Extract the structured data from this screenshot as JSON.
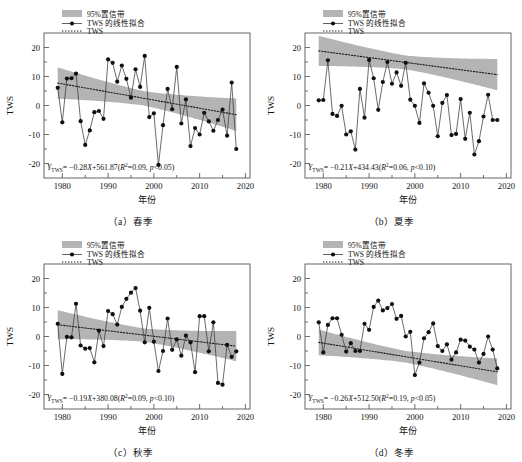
{
  "figure": {
    "panel_count": 4,
    "series_color": "#3a3a3a",
    "band_color": "#b4b4b4",
    "marker_color": "#101010",
    "axis_color": "#555555"
  },
  "axes": {
    "xlabel": "年份",
    "ylabel": "TWS",
    "xlim": [
      1976,
      2021
    ],
    "ylim": [
      -25,
      25
    ],
    "xticks": [
      1980,
      1990,
      2000,
      2010,
      2020
    ],
    "yticks": [
      20,
      10,
      0,
      -10,
      -20
    ],
    "xtick_labels": [
      "1980",
      "1990",
      "2000",
      "2010",
      "2020"
    ],
    "ytick_labels": [
      "20",
      "10",
      "0",
      "-10",
      "-20"
    ],
    "grid": false,
    "minor_ticks": true
  },
  "legend": {
    "position": "top-left",
    "items": [
      {
        "label": "95%置信带",
        "style": "band"
      },
      {
        "label": "TWS 的线性拟合",
        "style": "line-marker"
      },
      {
        "label": "TWS",
        "style": "dotted"
      }
    ]
  },
  "chart_data": [
    {
      "id": "a",
      "type": "line",
      "caption": "（a）春季",
      "season": "春季",
      "title": "",
      "xlabel": "年份",
      "ylabel": "TWS",
      "xlim": [
        1976,
        2021
      ],
      "ylim": [
        -25,
        25
      ],
      "equation": {
        "full": "YTWS= -0.28X+561.87(R2=0.09, p<0.05)",
        "slope": -0.28,
        "intercept": 561.87,
        "r2": 0.09,
        "p": "<0.05"
      },
      "trend": {
        "slope": -0.28,
        "intercept": 561.87
      },
      "band": {
        "half_width_at_ends": 5.6,
        "half_width_at_center": 2.5,
        "center_year": 1998
      },
      "x": [
        1979,
        1980,
        1981,
        1982,
        1983,
        1984,
        1985,
        1986,
        1987,
        1988,
        1989,
        1990,
        1991,
        1992,
        1993,
        1994,
        1995,
        1996,
        1997,
        1998,
        1999,
        2000,
        2001,
        2002,
        2003,
        2004,
        2005,
        2006,
        2007,
        2008,
        2009,
        2010,
        2011,
        2012,
        2013,
        2014,
        2015,
        2016,
        2017,
        2018
      ],
      "values": [
        6.1,
        -5.8,
        9.3,
        9.4,
        11.0,
        -5.4,
        -13.6,
        -8.6,
        -2.3,
        -1.9,
        -4.6,
        15.9,
        14.7,
        8.2,
        13.8,
        9.2,
        2.7,
        12.5,
        6.4,
        17.1,
        -4.0,
        -2.7,
        -20.5,
        -6.8,
        5.7,
        -1.3,
        13.3,
        -6.2,
        2.1,
        -14.0,
        -7.8,
        -10.0,
        -2.5,
        -5.5,
        -8.7,
        -5.0,
        -1.4,
        -10.4,
        7.9,
        -15.0
      ]
    },
    {
      "id": "b",
      "type": "line",
      "caption": "（b）夏季",
      "season": "夏季",
      "title": "",
      "xlabel": "年份",
      "ylabel": "TWS",
      "xlim": [
        1976,
        2021
      ],
      "ylim": [
        -25,
        25
      ],
      "equation": {
        "full": "YTWS= -0.21X+434.43(R2=0.06, p<0.10)",
        "slope": -0.21,
        "intercept": 434.43,
        "r2": 0.06,
        "p": "<0.10"
      },
      "trend": {
        "slope": -0.21,
        "intercept": 434.43
      },
      "band": {
        "half_width_at_ends": 5.4,
        "half_width_at_center": 2.4,
        "center_year": 1998
      },
      "x": [
        1979,
        1980,
        1981,
        1982,
        1983,
        1984,
        1985,
        1986,
        1987,
        1988,
        1989,
        1990,
        1991,
        1992,
        1993,
        1994,
        1995,
        1996,
        1997,
        1998,
        1999,
        2000,
        2001,
        2002,
        2003,
        2004,
        2005,
        2006,
        2007,
        2008,
        2009,
        2010,
        2011,
        2012,
        2013,
        2014,
        2015,
        2016,
        2017,
        2018
      ],
      "values": [
        1.8,
        1.9,
        15.6,
        -2.9,
        -3.6,
        -0.1,
        -10.0,
        -8.9,
        -15.2,
        5.7,
        -4.2,
        15.7,
        9.4,
        -1.5,
        8.1,
        15.0,
        7.5,
        11.4,
        6.8,
        14.7,
        2.0,
        -0.1,
        -6.0,
        7.6,
        4.4,
        -0.1,
        -10.6,
        0.9,
        3.6,
        -10.2,
        -9.8,
        2.2,
        -11.5,
        -2.5,
        -16.9,
        -12.3,
        -3.8,
        3.7,
        -5.0,
        -5.0
      ]
    },
    {
      "id": "c",
      "type": "line",
      "caption": "（c）秋季",
      "season": "秋季",
      "title": "",
      "xlabel": "年份",
      "ylabel": "TWS",
      "xlim": [
        1976,
        2021
      ],
      "ylim": [
        -25,
        25
      ],
      "equation": {
        "full": "YTWS= -0.19X+380.08(R2=0.09, p<0.10)",
        "slope": -0.19,
        "intercept": 380.08,
        "r2": 0.09,
        "p": "<0.10"
      },
      "trend": {
        "slope": -0.19,
        "intercept": 380.08
      },
      "band": {
        "half_width_at_ends": 5.2,
        "half_width_at_center": 2.3,
        "center_year": 1998
      },
      "x": [
        1979,
        1980,
        1981,
        1982,
        1983,
        1984,
        1985,
        1986,
        1987,
        1988,
        1989,
        1990,
        1991,
        1992,
        1993,
        1994,
        1995,
        1996,
        1997,
        1998,
        1999,
        2000,
        2001,
        2002,
        2003,
        2004,
        2005,
        2006,
        2007,
        2008,
        2009,
        2010,
        2011,
        2012,
        2013,
        2014,
        2015,
        2016,
        2017,
        2018
      ],
      "values": [
        4.4,
        -12.9,
        -0.1,
        -0.3,
        11.3,
        -3.1,
        -4.2,
        -4.0,
        -8.9,
        2.0,
        -3.3,
        8.8,
        7.7,
        4.1,
        10.2,
        13.0,
        15.1,
        16.7,
        8.9,
        -2.0,
        9.9,
        -1.8,
        -11.9,
        -5.0,
        6.2,
        -4.6,
        -1.0,
        -6.6,
        0.3,
        -2.0,
        -12.3,
        7.0,
        7.0,
        -5.1,
        4.9,
        -16.0,
        -16.6,
        -2.9,
        -7.0,
        -5.1
      ]
    },
    {
      "id": "d",
      "type": "line",
      "caption": "（d）冬季",
      "season": "冬季",
      "title": "",
      "xlabel": "年份",
      "ylabel": "TWS",
      "xlim": [
        1976,
        2021
      ],
      "ylim": [
        -25,
        25
      ],
      "equation": {
        "full": "YTWS= -0.26X+512.50(R2=0.19, p<0.05)",
        "slope": -0.26,
        "intercept": 512.5,
        "r2": 0.19,
        "p": "<0.05"
      },
      "trend": {
        "slope": -0.26,
        "intercept": 512.5
      },
      "band": {
        "half_width_at_ends": 4.6,
        "half_width_at_center": 2.0,
        "center_year": 1998
      },
      "x": [
        1979,
        1980,
        1981,
        1982,
        1983,
        1984,
        1985,
        1986,
        1987,
        1988,
        1989,
        1990,
        1991,
        1992,
        1993,
        1994,
        1995,
        1996,
        1997,
        1998,
        1999,
        2000,
        2001,
        2002,
        2003,
        2004,
        2005,
        2006,
        2007,
        2008,
        2009,
        2010,
        2011,
        2012,
        2013,
        2014,
        2015,
        2016,
        2017,
        2018
      ],
      "values": [
        4.9,
        -5.5,
        4.0,
        6.3,
        6.3,
        0.6,
        -5.2,
        -2.3,
        -5.0,
        -5.0,
        4.4,
        2.3,
        10.2,
        12.4,
        9.0,
        9.8,
        11.2,
        6.1,
        7.1,
        0.0,
        1.6,
        -13.3,
        -9.0,
        -0.6,
        1.5,
        4.5,
        -3.3,
        -5.0,
        -2.7,
        -8.0,
        -5.5,
        -1.1,
        -1.4,
        -3.5,
        -4.5,
        -9.0,
        -6.0,
        0.0,
        -4.5,
        -11.0
      ]
    }
  ]
}
